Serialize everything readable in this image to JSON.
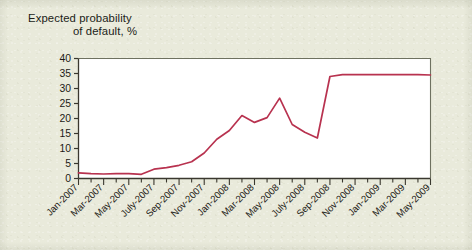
{
  "figure": {
    "title_line1": "Expected probability",
    "title_line2": "of default, %",
    "background_color": "#e9eadb",
    "plot_background_color": "#ffffff",
    "line_color": "#b8324f",
    "axis_color": "#6e7160"
  },
  "chart_data": {
    "type": "line",
    "title": "Expected probability of default, %",
    "xlabel": "",
    "ylabel": "Expected probability of default, %",
    "ylim": [
      0,
      40
    ],
    "yticks": [
      0,
      5,
      10,
      15,
      20,
      25,
      30,
      35,
      40
    ],
    "ytick_labels": [
      "0",
      "5",
      "10",
      "15",
      "20",
      "25",
      "30",
      "35",
      "40"
    ],
    "grid": false,
    "legend": "none",
    "x": [
      "Jan-2007",
      "Feb-2007",
      "Mar-2007",
      "Apr-2007",
      "May-2007",
      "June-2007",
      "July-2007",
      "Aug-2007",
      "Sep-2007",
      "Oct-2007",
      "Nov-2007",
      "Dec-2007",
      "Jan-2008",
      "Feb-2008",
      "Mar-2008",
      "Apr-2008",
      "May-2008",
      "June-2008",
      "July-2008",
      "Aug-2008",
      "Sep-2008",
      "Oct-2008",
      "Nov-2008",
      "Dec-2008",
      "Jan-2009",
      "Feb-2009",
      "Mar-2009",
      "Apr-2009",
      "May-2009"
    ],
    "xtick_labels": [
      "Jan-2007",
      "Mar-2007",
      "May-2007",
      "July-2007",
      "Sep-2007",
      "Nov-2007",
      "Jan-2008",
      "Mar-2008",
      "May-2008",
      "July-2008",
      "Sep-2008",
      "Nov-2008",
      "Jan-2009",
      "Mar-2009",
      "May-2009"
    ],
    "xtick_label_rotation_deg": 45,
    "series": [
      {
        "name": "Expected probability of default",
        "color": "#b8324f",
        "values": [
          1.9,
          1.6,
          1.5,
          1.6,
          1.6,
          1.4,
          3.1,
          3.6,
          4.4,
          5.6,
          8.5,
          13.1,
          16.0,
          21.0,
          18.7,
          20.3,
          26.8,
          18.0,
          15.4,
          13.5,
          34.0,
          34.6,
          34.6,
          34.6,
          34.6,
          34.6,
          34.6,
          34.6,
          34.5
        ]
      }
    ]
  }
}
